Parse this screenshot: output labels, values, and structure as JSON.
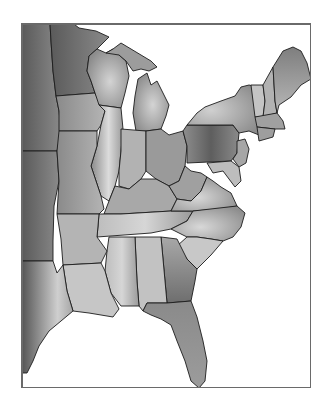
{
  "figure": {
    "type": "shaded-map",
    "region": "Eastern United States",
    "colormap": "grayscale",
    "frame": {
      "x": 21,
      "y": 23,
      "width": 290,
      "height": 365,
      "stroke": "#6a6a6a"
    },
    "colors": {
      "background": "#ffffff",
      "water": "#ffffff",
      "land_dark": "#5e5e5e",
      "land_mid": "#8f8f8f",
      "land_light": "#d2d2d2",
      "boundary": "#1c1c1c"
    },
    "states_shown": [
      "MN",
      "WI",
      "MI",
      "IA",
      "IL",
      "IN",
      "OH",
      "PA",
      "NY",
      "VT",
      "NH",
      "ME",
      "MA",
      "CT",
      "RI",
      "NJ",
      "DE",
      "MD",
      "WV",
      "VA",
      "KY",
      "TN",
      "NC",
      "SC",
      "GA",
      "FL",
      "AL",
      "MS",
      "LA",
      "AR",
      "MO",
      "TX",
      "OK",
      "KS",
      "NE",
      "SD",
      "ND"
    ],
    "light_bands": [
      "Illinois north-south corridor",
      "Lower Michigan center",
      "Western New York",
      "Virginia / North Carolina piedmont",
      "Alabama / Mississippi",
      "East Texas"
    ],
    "dark_areas": [
      "Western Minnesota / Dakotas",
      "Central Pennsylvania",
      "Southern Georgia",
      "Florida peninsula",
      "South Texas coast"
    ]
  }
}
